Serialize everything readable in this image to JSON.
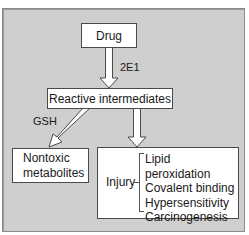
{
  "diagram": {
    "nodes": {
      "drug": "Drug",
      "reactive": "Reactive intermediates",
      "nontoxic_line1": "Nontoxic",
      "nontoxic_line2": "metabolites",
      "injury": "Injury",
      "injury_items": [
        "Lipid peroxidation",
        "Covalent binding",
        "Hypersensitivity",
        "Carcinogenesis"
      ]
    },
    "edges": {
      "drug_to_reactive": "2E1",
      "reactive_to_nontoxic": "GSH"
    },
    "colors": {
      "background": "#cfcfcf",
      "box_fill": "#ffffff",
      "border": "#4a4a4a"
    }
  }
}
